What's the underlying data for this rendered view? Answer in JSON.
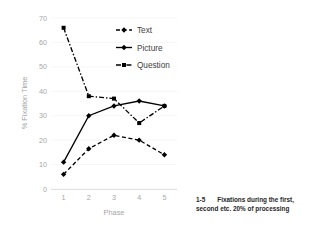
{
  "chart_data": {
    "type": "line",
    "title": "",
    "xlabel": "Phase",
    "ylabel": "% Fixation Time",
    "categories": [
      "1",
      "2",
      "3",
      "4",
      "5"
    ],
    "xticklabels": [
      "1",
      "2",
      "3",
      "4",
      "5"
    ],
    "yticklabels": [
      "0",
      "10",
      "20",
      "30",
      "40",
      "50",
      "60",
      "70"
    ],
    "ylim": [
      0,
      70
    ],
    "ytick_step": 10,
    "grid": "horizontal",
    "legend_position": "inside-top-right",
    "series": [
      {
        "name": "Text",
        "values": [
          6,
          16.5,
          22,
          20,
          14
        ],
        "linestyle": "dashed",
        "marker": "diamond",
        "color": "#000000"
      },
      {
        "name": "Picture",
        "values": [
          11,
          30,
          34,
          36,
          34
        ],
        "linestyle": "solid",
        "marker": "diamond",
        "color": "#000000"
      },
      {
        "name": "Question",
        "values": [
          66,
          38,
          37,
          27,
          34
        ],
        "linestyle": "dashdot",
        "marker": "square",
        "color": "#000000"
      }
    ]
  },
  "caption": {
    "key": "1-5",
    "line1": "Fixations during the first,",
    "line2": "second etc. 20% of processing"
  },
  "colors": {
    "ink": "#000000",
    "grid": "#f2f2f2",
    "axis": "#d9d9d9",
    "tick_text": "#a6a6a6",
    "legend_text": "#404040",
    "caption_text": "#262626",
    "background": "#ffffff"
  }
}
